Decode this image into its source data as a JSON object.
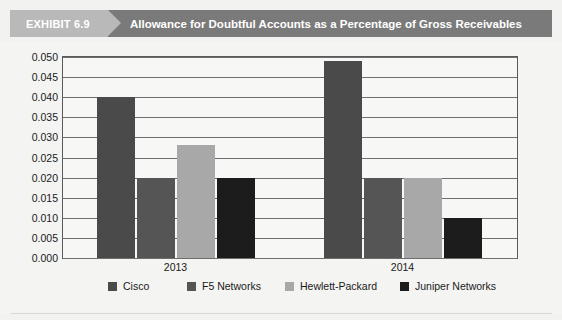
{
  "header": {
    "exhibit_label": "EXHIBIT 6.9",
    "title": "Allowance for Doubtful Accounts as a Percentage of Gross Receivables",
    "tag_color": "#b9b9b9",
    "banner_color": "#7a7a7a",
    "text_color": "#ffffff"
  },
  "chart_data": {
    "type": "bar",
    "title": "Allowance for Doubtful Accounts as a Percentage of Gross Receivables",
    "xlabel": "",
    "ylabel": "",
    "categories": [
      "2013",
      "2014"
    ],
    "series": [
      {
        "name": "Cisco",
        "values": [
          0.04,
          0.049
        ],
        "color": "#4a4a4a"
      },
      {
        "name": "F5 Networks",
        "values": [
          0.02,
          0.02
        ],
        "color": "#555555"
      },
      {
        "name": "Hewlett-Packard",
        "values": [
          0.028,
          0.02
        ],
        "color": "#a8a8a8"
      },
      {
        "name": "Juniper Networks",
        "values": [
          0.02,
          0.01
        ],
        "color": "#1c1c1c"
      }
    ],
    "ylim": [
      0.0,
      0.05
    ],
    "ytick_step": 0.005,
    "ytick_labels": [
      "0.000",
      "0.005",
      "0.010",
      "0.015",
      "0.020",
      "0.025",
      "0.030",
      "0.035",
      "0.040",
      "0.045",
      "0.050"
    ],
    "ytick_values": [
      0.0,
      0.005,
      0.01,
      0.015,
      0.02,
      0.025,
      0.03,
      0.035,
      0.04,
      0.045,
      0.05
    ],
    "grid": true,
    "legend_position": "bottom"
  }
}
